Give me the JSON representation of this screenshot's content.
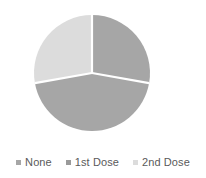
{
  "chart_data": {
    "type": "pie",
    "title": "",
    "subtitle": "",
    "xlabel": "",
    "ylabel": "",
    "grid": false,
    "legend_position": "bottom",
    "start_angle_deg": 0,
    "direction": "clockwise",
    "categories": [
      "None",
      "1st Dose",
      "2nd Dose"
    ],
    "values": [
      27.8,
      44.4,
      27.8
    ],
    "units": "percent",
    "slices": [
      {
        "label": "None",
        "value": 27.8,
        "start_angle_deg": 0,
        "end_angle_deg": 100,
        "color": "#a6a6a6"
      },
      {
        "label": "1st Dose",
        "value": 44.4,
        "start_angle_deg": 100,
        "end_angle_deg": 260,
        "color": "#a6a6a6"
      },
      {
        "label": "2nd Dose",
        "value": 27.8,
        "start_angle_deg": 260,
        "end_angle_deg": 360,
        "color": "#dcdcdc"
      }
    ],
    "colors": [
      "#a6a6a6",
      "#a6a6a6",
      "#dcdcdc"
    ],
    "separator_color": "#ffffff",
    "background_color": "#ffffff"
  },
  "legend": {
    "items": [
      {
        "label": "None",
        "color": "#a6a6a6",
        "marker": "square-marker"
      },
      {
        "label": "1st Dose",
        "color": "#9a9a9a",
        "marker": "square-marker"
      },
      {
        "label": "2nd Dose",
        "color": "#dcdcdc",
        "marker": "square-marker"
      }
    ]
  },
  "geometry": {
    "center_x": 92,
    "center_y": 73,
    "radius": 58
  }
}
